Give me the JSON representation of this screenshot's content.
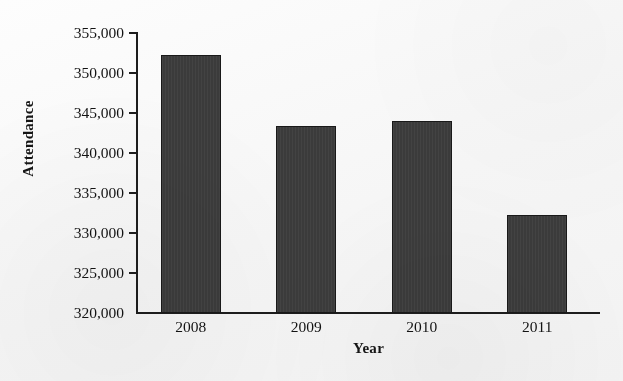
{
  "chart_data": {
    "type": "bar",
    "title": "",
    "categories": [
      "2008",
      "2009",
      "2010",
      "2011"
    ],
    "values": [
      352300,
      343400,
      344000,
      332300
    ],
    "xlabel": "Year",
    "ylabel": "Attendance",
    "ylim": [
      320000,
      355000
    ],
    "ytick_step": 5000,
    "ytick_labels": [
      "355,000",
      "350,000",
      "345,000",
      "340,000",
      "335,000",
      "330,000",
      "325,000",
      "320,000"
    ],
    "ytick_values": [
      355000,
      350000,
      345000,
      340000,
      335000,
      330000,
      325000,
      320000
    ],
    "grid": false,
    "legend": false,
    "legend_position": "none",
    "bar_color": "#3b3b3b",
    "bar_border_color": "#191919",
    "axis_color": "#1d1d1d",
    "background_color": "#fbfbfb",
    "text_color": "#131313"
  },
  "axes": {
    "y_title": "Attendance",
    "x_title": "Year"
  }
}
